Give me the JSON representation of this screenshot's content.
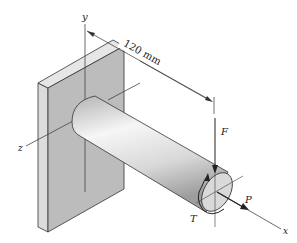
{
  "figure": {
    "type": "cantilever shaft fixed to wall plate",
    "dimension_label": "120 mm",
    "axes": {
      "x": "x",
      "y": "y",
      "z": "z"
    },
    "loads": {
      "force_vertical": "F",
      "axial_force": "P",
      "torque": "T"
    }
  },
  "colors": {
    "plate_front": "#bdbdbd",
    "plate_top": "#e2e2e2",
    "plate_side": "#d4d4d4",
    "shaft_light": "#f4f4f4",
    "shaft_dark": "#a9a9a9",
    "line": "#333333"
  }
}
